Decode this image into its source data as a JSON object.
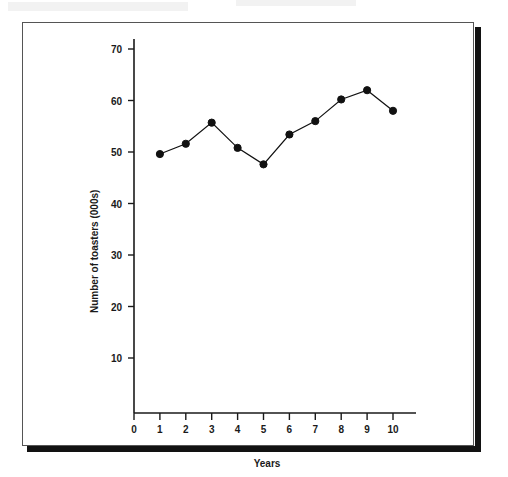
{
  "figure": {
    "frame_color": "#555555",
    "shadow_color": "#121212",
    "background": "#ffffff"
  },
  "chart_data": {
    "type": "line",
    "title": "",
    "subtitle": "",
    "xlabel": "Years",
    "ylabel": "Number of toasters (000s)",
    "x": [
      1,
      2,
      3,
      4,
      5,
      6,
      7,
      8,
      9,
      10
    ],
    "values": [
      49.6,
      51.6,
      55.7,
      50.8,
      47.6,
      53.4,
      56.0,
      60.2,
      62.0,
      58.0
    ],
    "series": [
      {
        "name": "Number of toasters (000s)",
        "values": [
          49.6,
          51.6,
          55.7,
          50.8,
          47.6,
          53.4,
          56.0,
          60.2,
          62.0,
          58.0
        ]
      }
    ],
    "xlim": [
      0,
      10.4
    ],
    "ylim": [
      3,
      72
    ],
    "xticks": [
      0,
      1,
      2,
      3,
      4,
      5,
      6,
      7,
      8,
      9,
      10
    ],
    "xtick_labels": [
      "0",
      "1",
      "2",
      "3",
      "4",
      "5",
      "6",
      "7",
      "8",
      "9",
      "10"
    ],
    "yticks": [
      10,
      20,
      30,
      40,
      50,
      60,
      70
    ],
    "ytick_labels": [
      "10",
      "20",
      "30",
      "40",
      "50",
      "60",
      "70"
    ],
    "grid": false,
    "legend": null,
    "legend_position": "none",
    "marker": "filled-circle",
    "marker_color": "#111111",
    "line_color": "#111111",
    "line_width": 1.2,
    "annotations": []
  }
}
